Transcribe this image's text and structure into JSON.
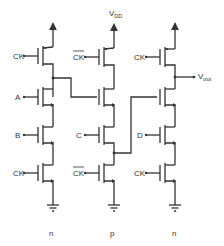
{
  "diagram": {
    "type": "CMOS domino logic circuit",
    "supply_label": "V",
    "supply_subscript": "DD",
    "output_label": "V",
    "output_subscript": "out",
    "columns": [
      {
        "label": "n",
        "gates": [
          "CK",
          "A",
          "B",
          "CK"
        ]
      },
      {
        "label": "p",
        "gates": [
          "CK",
          "",
          "C",
          "CK"
        ],
        "inverted_clock": true
      },
      {
        "label": "n",
        "gates": [
          "CK",
          "",
          "D",
          "CK"
        ]
      }
    ],
    "labels": {
      "ck": "CK",
      "a": "A",
      "b": "B",
      "c": "C",
      "d": "D",
      "col1": "n",
      "col2": "p",
      "col3": "n"
    }
  }
}
